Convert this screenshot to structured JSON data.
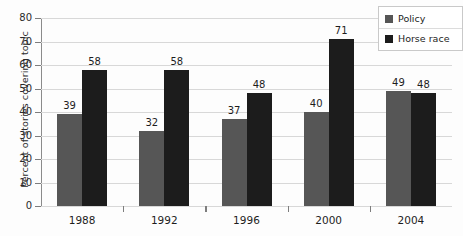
{
  "chart_data": {
    "type": "bar",
    "title": "",
    "xlabel": "",
    "ylabel": "Percent of stories covering topic",
    "ylim": [
      0,
      80
    ],
    "ytick_step": 10,
    "yticks": [
      "0",
      "10",
      "20",
      "30",
      "40",
      "50",
      "60",
      "70",
      "80"
    ],
    "grid": true,
    "legend_position": "top-right",
    "categories": [
      "1988",
      "1992",
      "1996",
      "2000",
      "2004"
    ],
    "series": [
      {
        "name": "Policy",
        "color": "#565656",
        "values": [
          39,
          32,
          37,
          40,
          49
        ],
        "labels": [
          "39",
          "32",
          "37",
          "40",
          "49"
        ]
      },
      {
        "name": "Horse race",
        "color": "#1c1c1c",
        "values": [
          58,
          58,
          48,
          71,
          48
        ],
        "labels": [
          "58",
          "58",
          "48",
          "71",
          "48"
        ]
      }
    ]
  },
  "legend": {
    "items": [
      {
        "label": "Policy",
        "swatch": "policy-swatch"
      },
      {
        "label": "Horse race",
        "swatch": "horse-race-swatch"
      }
    ]
  },
  "axes": {
    "y_title": "Percent of stories covering topic"
  }
}
